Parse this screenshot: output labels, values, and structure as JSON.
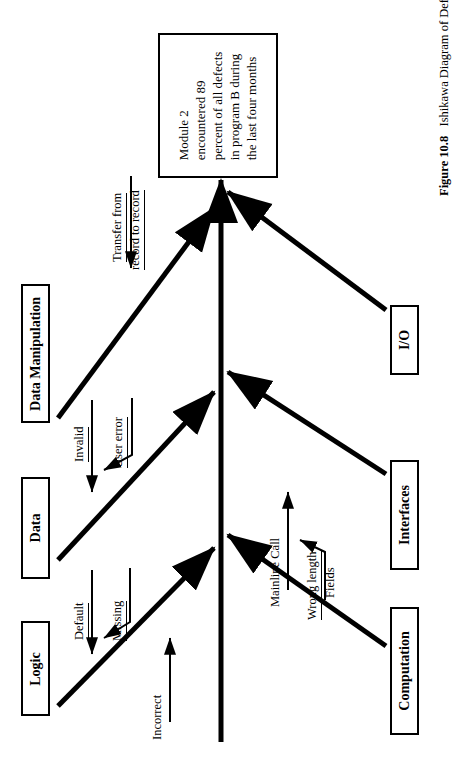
{
  "figure": {
    "type": "ishikawa-fishbone",
    "orientation": "rotated-90-ccw",
    "caption_number": "Figure 10.8",
    "caption_title": "Ishikawa Diagram of Defect Causes",
    "colors": {
      "ink": "#000000",
      "paper": "#ffffff"
    }
  },
  "effect": {
    "name": "effect-box",
    "lines": [
      "Module 2",
      "encountered 89",
      "percent of all defects",
      "in program B during",
      "the last four months"
    ],
    "text": "Module 2 encountered 89 percent of all defects in program B during the last four months"
  },
  "categories": [
    {
      "id": "data-manipulation",
      "label": "Data Manipulation",
      "side": "left",
      "causes": [
        "Transfer from record to record"
      ]
    },
    {
      "id": "data",
      "label": "Data",
      "side": "left",
      "causes": [
        "Invalid",
        "User error"
      ]
    },
    {
      "id": "logic",
      "label": "Logic",
      "side": "left",
      "causes": [
        "Default",
        "Missing",
        "Incorrect"
      ]
    },
    {
      "id": "io",
      "label": "I/O",
      "side": "right",
      "causes": []
    },
    {
      "id": "interfaces",
      "label": "Interfaces",
      "side": "right",
      "causes": [
        "Mainline Call",
        "Wrong length",
        "Fields"
      ]
    },
    {
      "id": "computation",
      "label": "Computation",
      "side": "right",
      "causes": []
    }
  ],
  "causes": {
    "transfer_l1": "Transfer from",
    "transfer_l2": "record to record",
    "invalid": "Invalid",
    "user_error": "User error",
    "default": "Default",
    "missing": "Missing",
    "incorrect": "Incorrect",
    "mainline_call": "Mainline Call",
    "wrong_length": "Wrong length",
    "fields": "Fields"
  }
}
